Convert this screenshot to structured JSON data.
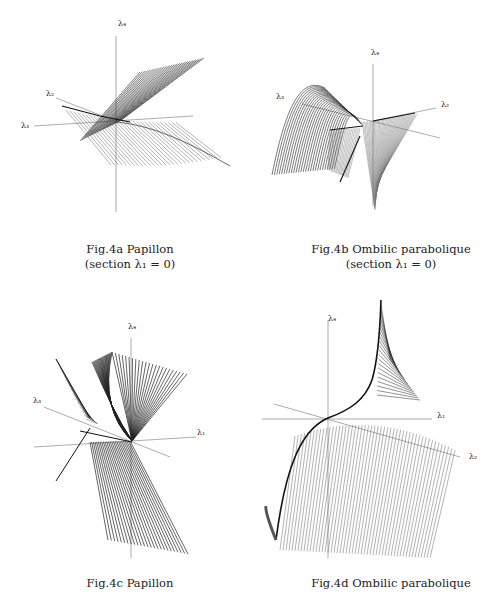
{
  "figures": [
    {
      "id": "4a",
      "caption_line1": "Fig.4a Papillon",
      "caption_line2": "(section λ₁ = 0)",
      "axis_labels": {
        "vertical": "λ₄",
        "left_upper": "λ₂",
        "left_lower": "λ₃"
      }
    },
    {
      "id": "4b",
      "caption_line1": "Fig.4b Ombilic parabolique",
      "caption_line2": "(section λ₁ = 0)",
      "axis_labels": {
        "vertical": "λ₄",
        "left": "λ₃",
        "right": "λ₂"
      }
    },
    {
      "id": "4c",
      "caption_line1": "Fig.4c Papillon",
      "axis_labels": {
        "vertical": "λ₄",
        "left": "λ₃",
        "right": "λ₁"
      }
    },
    {
      "id": "4d",
      "caption_line1": "Fig.4d Ombilic parabolique",
      "axis_labels": {
        "vertical": "λ₄",
        "right": "λ₁",
        "right_lower": "λ₂"
      }
    }
  ]
}
